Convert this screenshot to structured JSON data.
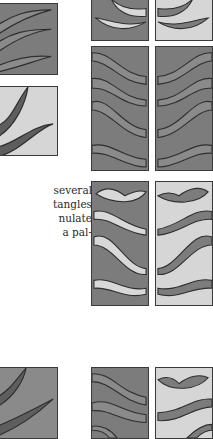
{
  "figure": {
    "colors": {
      "dark_fill": "#7c7c7c",
      "light_fill": "#d6d6d6",
      "ribbon_dark": "#5e5e5e",
      "ribbon_mid": "#8a8a8a",
      "ribbon_light": "#d8d8d8",
      "outline": "#2e2e2e"
    },
    "left_column": [
      {
        "name": "left-panel-1",
        "background": "dark",
        "pattern": "three-wave-bands"
      },
      {
        "name": "left-panel-2",
        "background": "light",
        "pattern": "two-dark-ribbons"
      },
      {
        "name": "left-panel-3",
        "background": "dark",
        "pattern": "two-dark-ribbons"
      }
    ],
    "right_grid": [
      {
        "row": 1,
        "left": "dark with light ribbons",
        "right": "light with dark ribbons"
      },
      {
        "row": 2,
        "left": "dark with outlined bands",
        "right": "dark with outlined bands mirrored"
      },
      {
        "row": 3,
        "left": "dark with light ribbons",
        "right": "light with dark ribbons"
      },
      {
        "row": 4,
        "left": "dark with outlined bands",
        "right": "light with dark ribbons"
      }
    ]
  },
  "body_text": {
    "lines": [
      "several",
      "tangles",
      "nulate",
      "a pal-"
    ]
  }
}
